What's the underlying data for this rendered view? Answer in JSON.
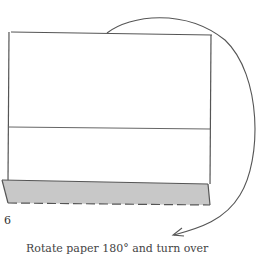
{
  "diagram": {
    "type": "folding-instruction",
    "step_number": "6",
    "caption": "Rotate paper 180° and turn over",
    "colors": {
      "line": "#555555",
      "flap_fill": "#c8c8c8",
      "background": "#ffffff"
    },
    "elements": [
      {
        "name": "paper-rectangle",
        "description": "Sheet outline"
      },
      {
        "name": "fold-crease-line",
        "description": "Horizontal crease across middle"
      },
      {
        "name": "folded-flap",
        "description": "Shaded strip at bottom with dashed lower edge"
      },
      {
        "name": "rotation-arrow",
        "description": "Curved arrow from top over right side to bottom"
      }
    ]
  }
}
